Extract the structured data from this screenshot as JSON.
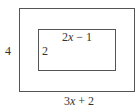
{
  "diagram": {
    "type": "nested-rectangles",
    "outer_rectangle": {
      "height_label": "4",
      "width_label": "3x + 2"
    },
    "inner_rectangle": {
      "height_label": "2",
      "width_label": "2x − 1"
    }
  }
}
